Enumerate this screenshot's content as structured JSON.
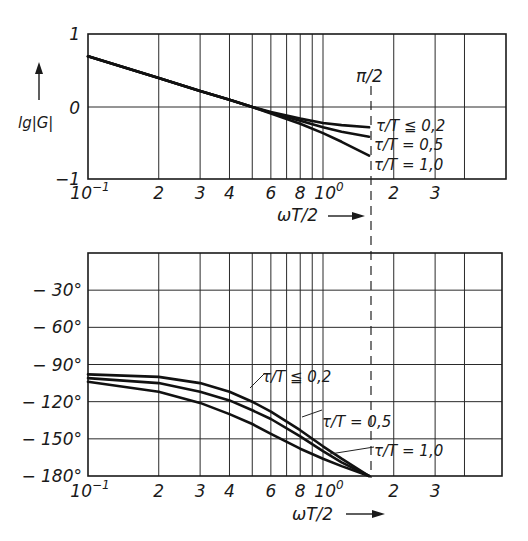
{
  "chart_data": [
    {
      "type": "line",
      "title": "",
      "xlabel": "ωT/2",
      "ylabel": "lg|G|",
      "xscale": "log",
      "xlim": [
        0.1,
        6.0
      ],
      "ylim": [
        -1,
        1
      ],
      "xtick_labels": [
        "10⁻¹",
        "2",
        "3",
        "4",
        "6",
        "8",
        "10⁰",
        "2",
        "3"
      ],
      "ytick_labels": [
        "1",
        "0",
        "−1"
      ],
      "annotation": "π/2",
      "annotation_x": 1.5708,
      "series": [
        {
          "name": "τ/T ≦ 0,2",
          "x": [
            0.1,
            0.2,
            0.3,
            0.4,
            0.5,
            0.6,
            0.8,
            1.0,
            1.2,
            1.5708
          ],
          "y": [
            0.7,
            0.4,
            0.22,
            0.1,
            0.0,
            -0.07,
            -0.16,
            -0.22,
            -0.25,
            -0.28
          ]
        },
        {
          "name": "τ/T = 0,5",
          "x": [
            0.1,
            0.2,
            0.3,
            0.4,
            0.5,
            0.6,
            0.8,
            1.0,
            1.2,
            1.5708
          ],
          "y": [
            0.7,
            0.4,
            0.22,
            0.1,
            0.0,
            -0.08,
            -0.19,
            -0.28,
            -0.34,
            -0.41
          ]
        },
        {
          "name": "τ/T = 1,0",
          "x": [
            0.1,
            0.2,
            0.3,
            0.4,
            0.5,
            0.6,
            0.8,
            1.0,
            1.2,
            1.5708
          ],
          "y": [
            0.7,
            0.4,
            0.22,
            0.1,
            0.0,
            -0.09,
            -0.23,
            -0.36,
            -0.48,
            -0.67
          ]
        }
      ],
      "grid": true,
      "legend_position": "inline labels at right of curves"
    },
    {
      "type": "line",
      "title": "",
      "xlabel": "ωT/2",
      "ylabel": "phase (°)",
      "xscale": "log",
      "xlim": [
        0.1,
        6.0
      ],
      "ylim": [
        -180,
        0
      ],
      "xtick_labels": [
        "10⁻¹",
        "2",
        "3",
        "4",
        "6",
        "8",
        "10⁰",
        "2",
        "3"
      ],
      "ytick_labels": [
        "−30°",
        "−60°",
        "−90°",
        "−120°",
        "−150°",
        "−180°"
      ],
      "series": [
        {
          "name": "τ/T ≦ 0,2",
          "x": [
            0.1,
            0.2,
            0.3,
            0.4,
            0.5,
            0.6,
            0.8,
            1.0,
            1.2,
            1.5708
          ],
          "y": [
            -98,
            -100,
            -105,
            -112,
            -120,
            -128,
            -143,
            -156,
            -166,
            -180
          ]
        },
        {
          "name": "τ/T = 0,5",
          "x": [
            0.1,
            0.2,
            0.3,
            0.4,
            0.5,
            0.6,
            0.8,
            1.0,
            1.2,
            1.5708
          ],
          "y": [
            -101,
            -105,
            -112,
            -119,
            -127,
            -134,
            -148,
            -160,
            -169,
            -180
          ]
        },
        {
          "name": "τ/T = 1,0",
          "x": [
            0.1,
            0.2,
            0.3,
            0.4,
            0.5,
            0.6,
            0.8,
            1.0,
            1.2,
            1.5708
          ],
          "y": [
            -104,
            -112,
            -121,
            -130,
            -138,
            -146,
            -158,
            -166,
            -172,
            -180
          ]
        }
      ],
      "grid": true,
      "legend_position": "inline labels at right of curves"
    }
  ],
  "labels": {
    "top_ylabel": "lg|G|",
    "top_y_1": "1",
    "top_y_0": "0",
    "top_y_m1": "−1",
    "xaxis_label": "ωT/2",
    "pi_half": "π/2",
    "x_ticks": [
      "10",
      "2",
      "3",
      "4",
      "6",
      "8",
      "10",
      "2",
      "3"
    ],
    "x_exp_first": "−1",
    "x_exp_decade": "0",
    "curve_02": "τ/T ≦ 0,2",
    "curve_05": "τ/T = 0,5",
    "curve_10": "τ/T = 1,0",
    "phase_ticks": [
      "− 30°",
      "− 60°",
      "− 90°",
      "− 120°",
      "− 150°",
      "− 180°"
    ]
  }
}
